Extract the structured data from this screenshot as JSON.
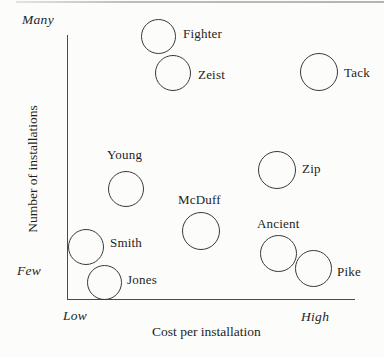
{
  "figure": {
    "background_color": "#fcfcfa",
    "ink_color": "#3a3a3a",
    "top_rule_color": "#b4b4b2"
  },
  "axes": {
    "y_title": "Number of installations",
    "x_title": "Cost per installation",
    "y_max_label": "Many",
    "y_min_label": "Few",
    "x_min_label": "Low",
    "x_max_label": "High"
  },
  "chart_data": {
    "type": "scatter",
    "title": "",
    "xlabel": "Cost per installation",
    "ylabel": "Number of installations",
    "marker": "open-circle",
    "grid": false,
    "legend": null,
    "x_axis": {
      "scale": "qualitative",
      "min_label": "Low",
      "max_label": "High",
      "range": [
        0,
        1
      ]
    },
    "y_axis": {
      "scale": "qualitative",
      "min_label": "Few",
      "max_label": "Many",
      "range": [
        0,
        1
      ]
    },
    "points": [
      {
        "label": "Fighter",
        "x": 0.32,
        "y": 1.0,
        "px": {
          "cx": 158,
          "cy": 36,
          "r": 17.5
        },
        "label_side": "right",
        "label_px": {
          "x": 183,
          "y": 26
        }
      },
      {
        "label": "Zeist",
        "x": 0.37,
        "y": 0.86,
        "px": {
          "cx": 173,
          "cy": 73,
          "r": 18
        },
        "label_side": "right",
        "label_px": {
          "x": 198,
          "y": 67
        }
      },
      {
        "label": "Tack",
        "x": 0.88,
        "y": 0.86,
        "px": {
          "cx": 319,
          "cy": 72,
          "r": 19
        },
        "label_side": "right",
        "label_px": {
          "x": 344,
          "y": 65
        }
      },
      {
        "label": "Young",
        "x": 0.2,
        "y": 0.42,
        "px": {
          "cx": 126,
          "cy": 189,
          "r": 18
        },
        "label_side": "above",
        "label_px": {
          "x": 107,
          "y": 147
        }
      },
      {
        "label": "Zip",
        "x": 0.73,
        "y": 0.49,
        "px": {
          "cx": 277,
          "cy": 170,
          "r": 19
        },
        "label_side": "right",
        "label_px": {
          "x": 302,
          "y": 161
        }
      },
      {
        "label": "McDuff",
        "x": 0.47,
        "y": 0.26,
        "px": {
          "cx": 201,
          "cy": 231,
          "r": 19
        },
        "label_side": "above",
        "label_px": {
          "x": 178,
          "y": 192
        }
      },
      {
        "label": "Ancient",
        "x": 0.73,
        "y": 0.17,
        "px": {
          "cx": 278,
          "cy": 253,
          "r": 18.5
        },
        "label_side": "above",
        "label_px": {
          "x": 257,
          "y": 216
        }
      },
      {
        "label": "Smith",
        "x": 0.07,
        "y": 0.2,
        "px": {
          "cx": 86,
          "cy": 247,
          "r": 18
        },
        "label_side": "right",
        "label_px": {
          "x": 110,
          "y": 235
        }
      },
      {
        "label": "Jones",
        "x": 0.13,
        "y": 0.06,
        "px": {
          "cx": 104,
          "cy": 282,
          "r": 17.5
        },
        "label_side": "right",
        "label_px": {
          "x": 127,
          "y": 272
        }
      },
      {
        "label": "Pike",
        "x": 0.85,
        "y": 0.12,
        "px": {
          "cx": 313,
          "cy": 268,
          "r": 18.5
        },
        "label_side": "right",
        "label_px": {
          "x": 337,
          "y": 264
        }
      }
    ]
  }
}
